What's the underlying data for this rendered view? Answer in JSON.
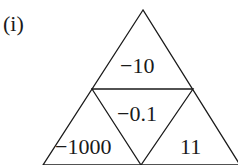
{
  "part_label": "(i)",
  "triangle": {
    "top": "−10",
    "center": "−0.1",
    "bottom_left": "−1000",
    "bottom_right": "11"
  }
}
